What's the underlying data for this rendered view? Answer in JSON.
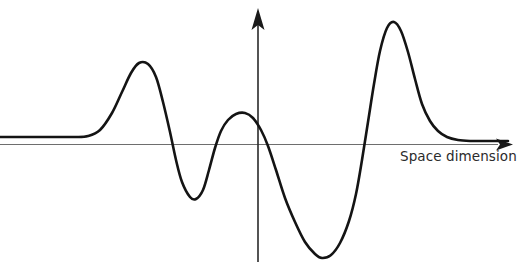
{
  "figure": {
    "background_color": "#ffffff"
  },
  "axes": {
    "x_axis": {
      "label": "Space dimension",
      "color": "#6e6e6e",
      "y_position": 144,
      "x_start": 0,
      "x_end": 508,
      "arrow": "right-arrow-icon"
    },
    "y_axis": {
      "label": "",
      "color": "#2a2a2a",
      "x_position": 258,
      "y_top": 12,
      "y_bottom": 262,
      "arrow": "up-arrow-icon"
    }
  },
  "chart_data": {
    "type": "line",
    "title": "",
    "subtitle": "",
    "xlabel": "Space dimension",
    "ylabel": "",
    "grid": false,
    "legend": null,
    "axis_origin_px": {
      "x": 258,
      "y": 144
    },
    "xlim": [
      0,
      518
    ],
    "ylim": [
      262,
      0
    ],
    "series": [
      {
        "name": "wave",
        "color": "#141414",
        "stroke_width": 2.6,
        "description": "Localized oscillatory wave packet, flat at both ends",
        "points_px": [
          [
            0,
            137
          ],
          [
            20,
            137
          ],
          [
            40,
            137
          ],
          [
            60,
            137
          ],
          [
            75,
            137
          ],
          [
            88,
            136
          ],
          [
            100,
            130
          ],
          [
            112,
            113
          ],
          [
            122,
            92
          ],
          [
            131,
            73
          ],
          [
            139,
            63
          ],
          [
            148,
            64
          ],
          [
            156,
            77
          ],
          [
            163,
            102
          ],
          [
            170,
            132
          ],
          [
            176,
            160
          ],
          [
            182,
            182
          ],
          [
            190,
            197
          ],
          [
            196,
            199
          ],
          [
            203,
            190
          ],
          [
            209,
            170
          ],
          [
            215,
            148
          ],
          [
            221,
            131
          ],
          [
            228,
            120
          ],
          [
            236,
            114
          ],
          [
            245,
            113
          ],
          [
            253,
            118
          ],
          [
            261,
            130
          ],
          [
            268,
            146
          ],
          [
            276,
            170
          ],
          [
            285,
            198
          ],
          [
            295,
            222
          ],
          [
            305,
            242
          ],
          [
            315,
            254
          ],
          [
            322,
            258
          ],
          [
            331,
            255
          ],
          [
            340,
            243
          ],
          [
            349,
            221
          ],
          [
            356,
            194
          ],
          [
            362,
            160
          ],
          [
            368,
            122
          ],
          [
            374,
            84
          ],
          [
            380,
            51
          ],
          [
            387,
            28
          ],
          [
            394,
            22
          ],
          [
            401,
            31
          ],
          [
            408,
            52
          ],
          [
            415,
            79
          ],
          [
            422,
            104
          ],
          [
            430,
            121
          ],
          [
            438,
            131
          ],
          [
            447,
            137
          ],
          [
            458,
            140
          ],
          [
            470,
            141
          ],
          [
            485,
            141
          ],
          [
            500,
            141
          ],
          [
            508,
            141
          ]
        ],
        "landmarks": [
          {
            "name": "flat-left-tail",
            "x": 0,
            "y": 137,
            "value": "baseline"
          },
          {
            "name": "peak-1",
            "x": 139,
            "y": 63,
            "value": "positive crest"
          },
          {
            "name": "trough-1",
            "x": 192,
            "y": 199,
            "value": "negative trough"
          },
          {
            "name": "peak-2",
            "x": 244,
            "y": 113,
            "value": "small positive crest"
          },
          {
            "name": "trough-2",
            "x": 322,
            "y": 258,
            "value": "deep negative trough"
          },
          {
            "name": "peak-3",
            "x": 390,
            "y": 22,
            "value": "tallest positive crest"
          },
          {
            "name": "flat-right-tail",
            "x": 505,
            "y": 141,
            "value": "baseline"
          }
        ],
        "zero_crossings_px": [
          165,
          217,
          268,
          362
        ]
      }
    ]
  },
  "labels": {
    "space_dimension": "Space dimension"
  }
}
